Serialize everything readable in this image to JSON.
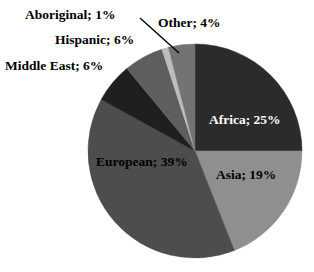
{
  "chart_data": {
    "type": "pie",
    "title": "",
    "categories": [
      "Africa",
      "Asia",
      "European",
      "Middle East",
      "Hispanic",
      "Aboriginal",
      "Other"
    ],
    "values": [
      25,
      19,
      39,
      6,
      6,
      1,
      4
    ],
    "value_unit": "%",
    "start_angle_deg": 0,
    "direction": "clockwise",
    "legend": "none",
    "grid": false,
    "labels": [
      {
        "key": "africa",
        "text": "Africa; 25%",
        "value": 25,
        "color": "#2b2b2b",
        "placement": "inside",
        "text_color": "#ffffff"
      },
      {
        "key": "asia",
        "text": "Asia; 19%",
        "value": 19,
        "color": "#8f8f8f",
        "placement": "inside",
        "text_color": "#000000"
      },
      {
        "key": "european",
        "text": "European; 39%",
        "value": 39,
        "color": "#4d4d4d",
        "placement": "inside",
        "text_color": "#000000"
      },
      {
        "key": "middle_east",
        "text": "Middle East; 6%",
        "value": 6,
        "color": "#1f1f1f",
        "placement": "outside",
        "text_color": "#000000"
      },
      {
        "key": "hispanic",
        "text": "Hispanic; 6%",
        "value": 6,
        "color": "#5e5e5e",
        "placement": "outside",
        "text_color": "#000000"
      },
      {
        "key": "aboriginal",
        "text": "Aboriginal; 1%",
        "value": 1,
        "color": "#bdbdbd",
        "placement": "outside",
        "text_color": "#000000"
      },
      {
        "key": "other",
        "text": "Other; 4%",
        "value": 4,
        "color": "#737373",
        "placement": "outside",
        "text_color": "#000000"
      }
    ],
    "colors": {
      "africa": "#2b2b2b",
      "asia": "#8f8f8f",
      "european": "#4d4d4d",
      "middle_east": "#1f1f1f",
      "hispanic": "#5e5e5e",
      "aboriginal": "#bdbdbd",
      "other": "#737373",
      "background": "#ffffff",
      "leader_line": "#000000"
    }
  },
  "labels": {
    "africa": "Africa; 25%",
    "asia": "Asia; 19%",
    "european": "European; 39%",
    "middle_east": "Middle East; 6%",
    "hispanic": "Hispanic; 6%",
    "aboriginal": "Aboriginal; 1%",
    "other": "Other; 4%"
  }
}
